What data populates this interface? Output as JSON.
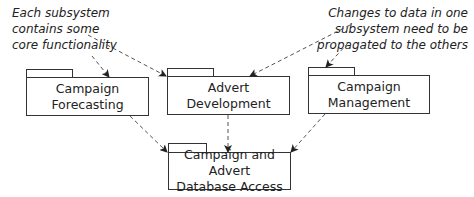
{
  "notes": {
    "left": {
      "lines": [
        "Each subsystem",
        "contains some",
        "core functionality"
      ]
    },
    "right": {
      "lines": [
        "Changes to data in one",
        "subsystem need to be",
        "propagated to the others"
      ]
    }
  },
  "packages": {
    "forecasting": {
      "lines": [
        "Campaign",
        "Forecasting"
      ]
    },
    "advert": {
      "lines": [
        "Advert",
        "Development"
      ]
    },
    "management": {
      "lines": [
        "Campaign",
        "Management"
      ]
    },
    "database": {
      "lines": [
        "Campaign and Advert",
        "Database Access"
      ]
    }
  },
  "style": {
    "line_color": "#333333",
    "dash_color": "#555555",
    "background": "#ffffff"
  }
}
